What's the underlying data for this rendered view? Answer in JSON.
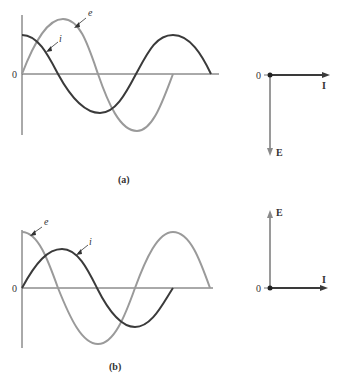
{
  "figure": {
    "panel_a": {
      "caption": "(a)",
      "waveform": {
        "origin_label": "0",
        "current_label": "i",
        "voltage_label": "e",
        "description": "Current i leads voltage e by 90 degrees"
      },
      "phasor": {
        "origin_label": "0",
        "current_label": "I",
        "voltage_label": "E",
        "current_direction": "right",
        "voltage_direction": "down"
      }
    },
    "panel_b": {
      "caption": "(b)",
      "waveform": {
        "origin_label": "0",
        "current_label": "i",
        "voltage_label": "e",
        "description": "Voltage e leads current i by 90 degrees"
      },
      "phasor": {
        "origin_label": "0",
        "current_label": "I",
        "voltage_label": "E",
        "current_direction": "right",
        "voltage_direction": "up"
      }
    }
  },
  "colors": {
    "current": "#3a3a3a",
    "voltage": "#9a9a9a",
    "axis": "#555555"
  }
}
